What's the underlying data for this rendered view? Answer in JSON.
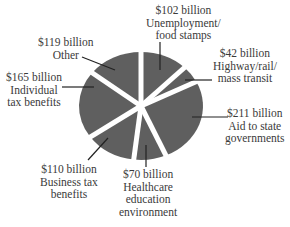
{
  "chart_data": {
    "type": "pie",
    "title": "",
    "unit": "billion USD",
    "slice_color": "#5f5f5f",
    "start_angle_deg": 0,
    "direction": "clockwise",
    "slices": [
      {
        "key": "unemployment",
        "value": 102,
        "value_label": "$102 billion",
        "label_lines": [
          "Unemployment/",
          "food stamps"
        ]
      },
      {
        "key": "highway",
        "value": 42,
        "value_label": "$42 billion",
        "label_lines": [
          "Highway/rail/",
          "mass transit"
        ]
      },
      {
        "key": "aid",
        "value": 211,
        "value_label": "$211 billion",
        "label_lines": [
          "Aid to state",
          "governments"
        ]
      },
      {
        "key": "healthcare",
        "value": 70,
        "value_label": "$70 billion",
        "label_lines": [
          "Healthcare",
          "education",
          "environment"
        ]
      },
      {
        "key": "business",
        "value": 110,
        "value_label": "$110 billion",
        "label_lines": [
          "Business tax",
          "benefits"
        ]
      },
      {
        "key": "individual",
        "value": 165,
        "value_label": "$165 billion",
        "label_lines": [
          "Individual",
          "tax benefits"
        ]
      },
      {
        "key": "other",
        "value": 119,
        "value_label": "$119 billion",
        "label_lines": [
          "Other"
        ]
      }
    ],
    "categories": [
      "Unemployment/food stamps",
      "Highway/rail/mass transit",
      "Aid to state governments",
      "Healthcare education environment",
      "Business tax benefits",
      "Individual tax benefits",
      "Other"
    ],
    "values": [
      102,
      42,
      211,
      70,
      110,
      165,
      119
    ]
  },
  "labels": {
    "unemployment": {
      "value": "$102 billion",
      "line1": "Unemployment/",
      "line2": "food stamps"
    },
    "highway": {
      "value": "$42 billion",
      "line1": "Highway/rail/",
      "line2": "mass transit"
    },
    "aid": {
      "value": "$211 billion",
      "line1": "Aid to state",
      "line2": "governments"
    },
    "healthcare": {
      "value": "$70 billion",
      "line1": "Healthcare",
      "line2": "education",
      "line3": "environment"
    },
    "business": {
      "value": "$110 billion",
      "line1": "Business tax",
      "line2": "benefits"
    },
    "individual": {
      "value": "$165 billion",
      "line1": "Individual",
      "line2": "tax benefits"
    },
    "other": {
      "value": "$119 billion",
      "line1": "Other"
    }
  }
}
